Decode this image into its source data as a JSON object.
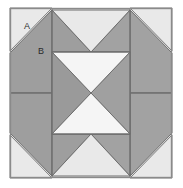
{
  "figure": {
    "name": "quilt-block-diagram",
    "canvas": {
      "width": 183,
      "height": 188
    },
    "frame": {
      "x": 10,
      "y": 8,
      "width": 162,
      "height": 170
    }
  },
  "colors": {
    "page_background": "#ffffff",
    "background_patch": "#e6e6e6",
    "background_patch_alt": "#ebebeb",
    "medium_gray_patch": "#9c9c9c",
    "medium_gray_patch_alt": "#a4a4a4",
    "light_patch": "#f4f4f4",
    "outline": "#6e6e6e",
    "frame_border": "#8a8a8a",
    "label_text": "#2b2b2b"
  },
  "labels": [
    {
      "id": "label-a",
      "text": "A",
      "x": 27,
      "y": 29
    },
    {
      "id": "label-b",
      "text": "B",
      "x": 41,
      "y": 54
    }
  ],
  "geometry": {
    "left_edge": 10,
    "right_edge": 172,
    "top_edge": 8,
    "bottom_edge": 178,
    "inner_left": 52,
    "inner_right": 130,
    "mid_x": 91,
    "mid_y": 93,
    "inner_top": 52,
    "inner_bottom": 134
  }
}
